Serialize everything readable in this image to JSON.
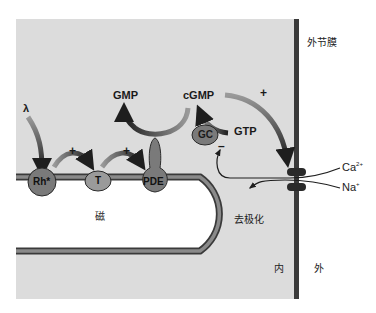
{
  "diagram": {
    "type": "phototransduction-cascade",
    "colors": {
      "cytoplasm": "#dcdcdc",
      "outside": "#ffffff",
      "membrane_dark": "#3a3a3a",
      "membrane_mid": "#8a8a8a",
      "protein_fill": "#8c8c8c",
      "arrow_dark": "#2a2a2a"
    },
    "labels": {
      "light": "λ",
      "gmp": "GMP",
      "cgmp": "cGMP",
      "gtp": "GTP",
      "gc": "GC",
      "rh": "Rh*",
      "transducin": "T",
      "pde": "PDE",
      "plus_rh_t": "+",
      "plus_t_pde": "+",
      "plus_cgmp_channel": "+",
      "minus_gc": "–",
      "disc": "磁",
      "outer_membrane": "外节膜",
      "ca_ion": "Ca",
      "ca_charge": "2+",
      "na_ion": "Na",
      "na_charge": "+",
      "depolarization": "去极化",
      "inside": "内",
      "outside": "外"
    },
    "nodes": [
      "λ",
      "Rh*",
      "T",
      "PDE",
      "cGMP",
      "GMP",
      "GTP",
      "GC",
      "channel"
    ],
    "edges": [
      {
        "from": "λ",
        "to": "Rh*",
        "sign": ""
      },
      {
        "from": "Rh*",
        "to": "T",
        "sign": "+"
      },
      {
        "from": "T",
        "to": "PDE",
        "sign": "+"
      },
      {
        "from": "cGMP",
        "to": "GMP",
        "sign": "",
        "via": "PDE"
      },
      {
        "from": "GTP",
        "to": "cGMP",
        "sign": "",
        "via": "GC"
      },
      {
        "from": "cGMP",
        "to": "channel",
        "sign": "+"
      },
      {
        "from": "Ca2+",
        "to": "GC",
        "sign": "–"
      },
      {
        "from": "Na+",
        "to": "去极化",
        "sign": ""
      }
    ]
  }
}
